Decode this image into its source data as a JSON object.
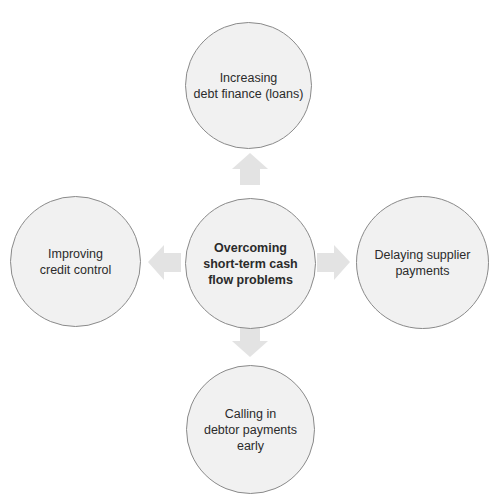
{
  "diagram": {
    "type": "hub-and-spoke",
    "center": {
      "label": "Overcoming\nshort-term cash\nflow problems"
    },
    "nodes": [
      {
        "position": "top",
        "label": "Increasing\ndebt finance (loans)"
      },
      {
        "position": "left",
        "label": "Improving\ncredit control"
      },
      {
        "position": "right",
        "label": "Delaying supplier\npayments"
      },
      {
        "position": "bottom",
        "label": "Calling in\ndebtor payments\nearly"
      }
    ],
    "colors": {
      "node_fill": "#f1f1f1",
      "node_border": "#8a8a8a",
      "arrow_fill": "#e3e3e3",
      "text": "#2b2b2b"
    }
  }
}
